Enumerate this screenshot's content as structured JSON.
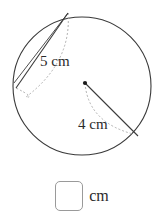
{
  "figure": {
    "type": "circle-geometry-diagram",
    "circle": {
      "center_x": 82,
      "center_y": 86,
      "radius": 69,
      "stroke": "#3a3a3a"
    },
    "center_dot": {
      "x": 85,
      "y": 83,
      "color": "#1a1a1a"
    },
    "chord": {
      "label": "5 cm",
      "value": 5,
      "unit": "cm",
      "from_x": 68,
      "from_y": 13,
      "to_x": 16,
      "to_y": 88,
      "label_x": 40,
      "label_y": 66,
      "stroke": "#3a3a3a"
    },
    "radius_segment": {
      "label": "4 cm",
      "value": 4,
      "unit": "cm",
      "from_x": 85,
      "from_y": 83,
      "to_x": 138,
      "to_y": 136,
      "label_x": 78,
      "label_y": 129,
      "stroke": "#3a3a3a"
    },
    "dashed_guides": {
      "stroke": "#a8a8a8",
      "dash_pattern": "2,2",
      "upper_arc_label": "arc-guide-upper-left",
      "lower_arc_label": "arc-guide-lower-right"
    },
    "labels": [
      {
        "text": "5 cm",
        "x": 40,
        "y": 66
      },
      {
        "text": "4 cm",
        "x": 78,
        "y": 129
      }
    ]
  },
  "answer": {
    "value": "",
    "placeholder": "",
    "unit": "cm"
  }
}
